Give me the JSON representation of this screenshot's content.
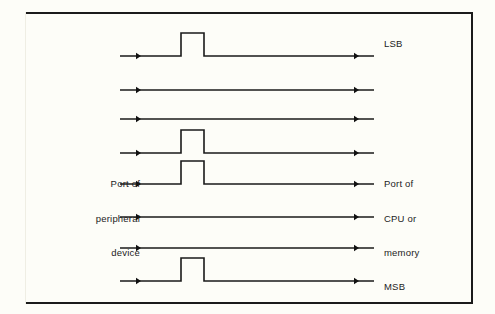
{
  "figure": {
    "kind": "parallel-data-transfer-timing-diagram",
    "background_color": "#fdfdf8",
    "line_color": "#1a1a1a",
    "frame_color": "#1b1b1b",
    "bit_line_count": 8
  },
  "labels": {
    "lsb": "LSB",
    "msb": "MSB",
    "source_line_1": "Port of",
    "source_line_2": "peripheral",
    "source_line_3": "device",
    "destination_line_1": "Port of",
    "destination_line_2": "CPU or",
    "destination_line_3": "memory"
  },
  "chart_data": {
    "type": "line",
    "title": "",
    "xlabel": "",
    "ylabel": "",
    "grid": false,
    "legend": "none",
    "axis_x_range": [
      120,
      374
    ],
    "geometry": {
      "line_start_x": 120,
      "line_end_x": 374,
      "left_arrow_x": 141,
      "right_arrow_x": 359,
      "pulse_rise_x": 181,
      "pulse_fall_x": 204,
      "pulse_height": 23
    },
    "categories": [
      "bit 0 (LSB)",
      "bit 1",
      "bit 2",
      "bit 3",
      "bit 4",
      "bit 5",
      "bit 6",
      "bit 7 (MSB)"
    ],
    "series": [
      {
        "name": "logic level",
        "values": [
          1,
          0,
          0,
          1,
          1,
          0,
          0,
          1
        ]
      }
    ],
    "lines": [
      {
        "index": 0,
        "name": "bit 0 (LSB)",
        "baseline_y": 56,
        "pulse": true,
        "end_label": "LSB"
      },
      {
        "index": 1,
        "name": "bit 1",
        "baseline_y": 90,
        "pulse": false,
        "end_label": ""
      },
      {
        "index": 2,
        "name": "bit 2",
        "baseline_y": 119,
        "pulse": false,
        "end_label": ""
      },
      {
        "index": 3,
        "name": "bit 3",
        "baseline_y": 153,
        "pulse": true,
        "end_label": ""
      },
      {
        "index": 4,
        "name": "bit 4",
        "baseline_y": 184,
        "pulse": true,
        "end_label": ""
      },
      {
        "index": 5,
        "name": "bit 5",
        "baseline_y": 217,
        "pulse": false,
        "end_label": ""
      },
      {
        "index": 6,
        "name": "bit 6",
        "baseline_y": 248,
        "pulse": false,
        "end_label": ""
      },
      {
        "index": 7,
        "name": "bit 7 (MSB)",
        "baseline_y": 281,
        "pulse": true,
        "end_label": "MSB"
      }
    ]
  }
}
